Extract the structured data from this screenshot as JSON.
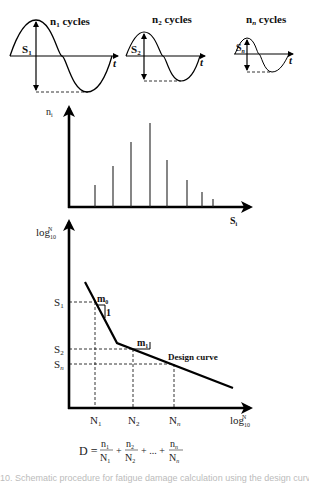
{
  "panels": {
    "load_cycles": [
      {
        "label_n": "n",
        "label_sub": "1",
        "label_rest": " cycles",
        "amp_label": "S",
        "amp_sub": "1",
        "time_label": "t"
      },
      {
        "label_n": "n",
        "label_sub": "2",
        "label_rest": " cycles",
        "amp_label": "S",
        "amp_sub": "2",
        "time_label": "t"
      },
      {
        "label_n": "n",
        "label_sub": "n",
        "label_rest": " cycles",
        "amp_label": "S",
        "amp_sub": "n",
        "time_label": "t"
      }
    ],
    "histogram": {
      "y_label": "n",
      "y_sub": "i",
      "x_label": "S",
      "x_sub": "i"
    },
    "sn_curve": {
      "y_label": "log",
      "y_sub": "10",
      "y_sup": "N",
      "x_label": "log",
      "x_sub": "10",
      "x_sup": "N",
      "s_levels": [
        {
          "label": "S",
          "sub": "1"
        },
        {
          "label": "S",
          "sub": "2"
        },
        {
          "label": "S",
          "sub": "n"
        }
      ],
      "n_levels": [
        {
          "label": "N",
          "sub": "1"
        },
        {
          "label": "N",
          "sub": "2"
        },
        {
          "label": "N",
          "sub": "n"
        }
      ],
      "slope_labels": [
        {
          "label": "m",
          "sub": "0",
          "run": "1"
        },
        {
          "label": "m",
          "sub": "1"
        }
      ],
      "curve_label": "Design curve"
    },
    "formula": {
      "lhs": "D =",
      "terms": [
        {
          "num": "n",
          "num_sub": "1",
          "den": "N",
          "den_sub": "1"
        },
        {
          "num": "n",
          "num_sub": "2",
          "den": "N",
          "den_sub": "2"
        },
        {
          "num": "n",
          "num_sub": "n",
          "den": "N",
          "den_sub": "n"
        }
      ],
      "plus": "+",
      "ellipsis": "+ ... +"
    }
  },
  "chart_data": {
    "type": "bar",
    "xlabel": "S_i",
    "ylabel": "n_i",
    "categories": [
      "1",
      "2",
      "3",
      "4",
      "5",
      "6",
      "7",
      "8"
    ],
    "values": [
      22,
      41,
      65,
      84,
      47,
      27,
      15,
      8
    ]
  },
  "caption": "10. Schematic procedure for fatigue damage calculation using the design curve"
}
